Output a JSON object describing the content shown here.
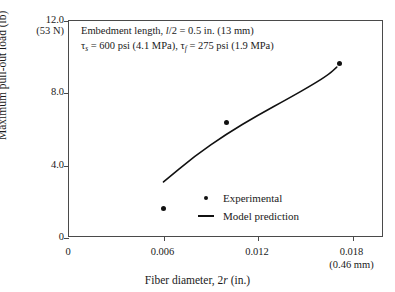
{
  "chart_data": {
    "type": "scatter",
    "title": "",
    "xlabel": "Fiber diameter, 2r (in.)",
    "ylabel": "Maximum pull-out load (lb)",
    "xlim": [
      0,
      0.02
    ],
    "ylim": [
      0,
      12.0
    ],
    "grid": false,
    "legend_position": "inside-lower-center",
    "xticks": [
      {
        "value": 0,
        "label": "0",
        "sublabel": ""
      },
      {
        "value": 0.006,
        "label": "0.006",
        "sublabel": ""
      },
      {
        "value": 0.012,
        "label": "0.012",
        "sublabel": ""
      },
      {
        "value": 0.018,
        "label": "0.018",
        "sublabel": "(0.46 mm)"
      }
    ],
    "yticks": [
      {
        "value": 0,
        "label": "0",
        "sublabel": ""
      },
      {
        "value": 4.0,
        "label": "4.0",
        "sublabel": ""
      },
      {
        "value": 8.0,
        "label": "8.0",
        "sublabel": ""
      },
      {
        "value": 12.0,
        "label": "12.0",
        "sublabel": "(53 N)"
      }
    ],
    "series": [
      {
        "name": "Experimental",
        "type": "scatter",
        "marker": "filled-circle",
        "color": "#111111",
        "points": [
          {
            "x": 0.006,
            "y": 1.65
          },
          {
            "x": 0.01,
            "y": 6.4
          },
          {
            "x": 0.0172,
            "y": 9.65
          }
        ]
      },
      {
        "name": "Model prediction",
        "type": "line",
        "color": "#111111",
        "points": [
          {
            "x": 0.006,
            "y": 3.1
          },
          {
            "x": 0.008,
            "y": 4.55
          },
          {
            "x": 0.01,
            "y": 5.75
          },
          {
            "x": 0.012,
            "y": 6.8
          },
          {
            "x": 0.014,
            "y": 7.75
          },
          {
            "x": 0.0155,
            "y": 8.5
          },
          {
            "x": 0.0165,
            "y": 9.05
          },
          {
            "x": 0.017,
            "y": 9.45
          }
        ]
      }
    ],
    "annotations": {
      "line1_pre": "Embedment length, ",
      "line1_var": "l",
      "line1_post": "/2 = 0.5 in. (13 mm)",
      "line2_tau1": "τ",
      "line2_tau1_sub": "s",
      "line2_mid": " = 600 psi (4.1 MPa), ",
      "line2_tau2": "τ",
      "line2_tau2_sub": "f",
      "line2_end": " = 275 psi (1.9 MPa)"
    }
  },
  "axis": {
    "ylabel": "Maximum pull-out load (lb)",
    "xlabel_pre": "Fiber diameter, 2",
    "xlabel_var": "r",
    "xlabel_post": " (in.)"
  },
  "legend": {
    "items": [
      {
        "label": "Experimental",
        "key": "marker-dot"
      },
      {
        "label": "Model prediction",
        "key": "line-segment"
      }
    ]
  },
  "colors": {
    "data": "#111111",
    "axis": "#4a4a4a",
    "background": "#ffffff"
  }
}
